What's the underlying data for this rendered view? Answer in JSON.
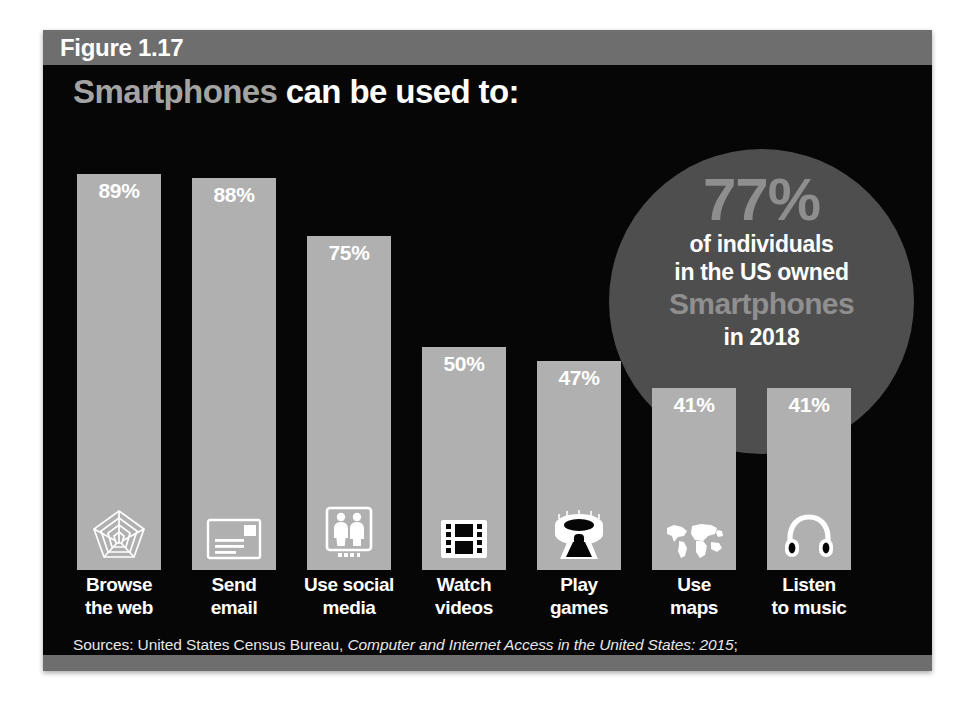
{
  "figure": {
    "label": "Figure 1.17",
    "title_emphasis": "Smartphones",
    "title_rest": " can be used to:"
  },
  "callout": {
    "value": "77%",
    "line1": "of individuals",
    "line2": "in the US owned",
    "brand": "Smartphones",
    "line3": "in 2018"
  },
  "sources": {
    "line1_prefix": "Sources: United States Census Bureau, ",
    "line1_italic": "Computer and Internet Access in the United States: 2015",
    "line1_suffix": ";",
    "line2": "Aaron Smith, “US Smartphone Use in 2015,” Pew Research Center, Internet & Technology, 2015"
  },
  "colors": {
    "background": "#060606",
    "bar": "#b0b0b0",
    "callout_circle": "#4e4e4e",
    "band": "#6e6e6e",
    "accent_text": "#8f8f8f",
    "white_text": "#ffffff"
  },
  "chart_data": {
    "type": "bar",
    "title": "Smartphones can be used to:",
    "xlabel": "",
    "ylabel": "",
    "ylim": [
      0,
      100
    ],
    "grid": false,
    "legend": "none",
    "units": "percent",
    "categories": [
      "Browse the web",
      "Send email",
      "Use social media",
      "Watch videos",
      "Play games",
      "Use maps",
      "Listen to music"
    ],
    "category_lines": [
      [
        "Browse",
        "the web"
      ],
      [
        "Send",
        "email"
      ],
      [
        "Use social",
        "media"
      ],
      [
        "Watch",
        "videos"
      ],
      [
        "Play",
        "games"
      ],
      [
        "Use",
        "maps"
      ],
      [
        "Listen",
        "to music"
      ]
    ],
    "values": [
      89,
      88,
      75,
      50,
      47,
      41,
      41
    ],
    "value_labels": [
      "89%",
      "88%",
      "75%",
      "50%",
      "47%",
      "41%",
      "41%"
    ],
    "icons": [
      "spider-web-icon",
      "envelope-icon",
      "social-people-icon",
      "film-strip-icon",
      "stadium-icon",
      "world-map-icon",
      "headphones-icon"
    ],
    "annotation": {
      "value": 77,
      "text": "77% of individuals in the US owned Smartphones in 2018"
    }
  }
}
